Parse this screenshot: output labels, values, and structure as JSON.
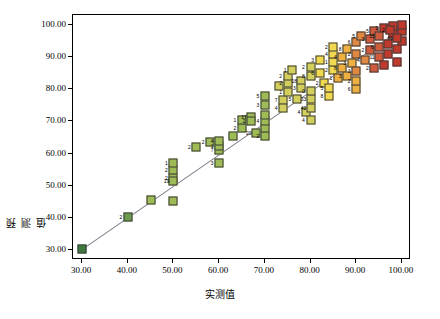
{
  "chart_data": {
    "type": "scatter",
    "title": "",
    "xlabel": "实测值",
    "ylabel": "预测值",
    "xlim": [
      28.0,
      102.0
    ],
    "ylim": [
      27.0,
      103.0
    ],
    "xticks": [
      "30.00",
      "40.00",
      "50.00",
      "60.00",
      "70.00",
      "80.00",
      "90.00",
      "100.00"
    ],
    "xtick_values": [
      30,
      40,
      50,
      60,
      70,
      80,
      90,
      100
    ],
    "yticks": [
      "30.00",
      "40.00",
      "50.00",
      "60.00",
      "70.00",
      "80.00",
      "90.00",
      "100.00"
    ],
    "ytick_values": [
      30,
      40,
      50,
      60,
      70,
      80,
      90,
      100
    ],
    "grid": false,
    "legend": null,
    "colormap": [
      "#3e7a3e",
      "#6f9b4e",
      "#9fbb55",
      "#d2cf5c",
      "#f0d84f",
      "#efb042",
      "#e08742",
      "#cf5b3c",
      "#c0392b"
    ],
    "marker": "square",
    "fit_line": {
      "from": [
        30,
        30.5
      ],
      "to": [
        100,
        99.0
      ]
    },
    "points": [
      {
        "x": 30.0,
        "y": 30.5,
        "c": 0,
        "label": ""
      },
      {
        "x": 40.0,
        "y": 40.4,
        "c": 1,
        "label": "2"
      },
      {
        "x": 45.0,
        "y": 45.5,
        "c": 2,
        "label": ""
      },
      {
        "x": 50.0,
        "y": 45.2,
        "c": 2,
        "label": ""
      },
      {
        "x": 50.0,
        "y": 52.5,
        "c": 2,
        "label": "2"
      },
      {
        "x": 50.0,
        "y": 55.0,
        "c": 2,
        "label": "2"
      },
      {
        "x": 50.0,
        "y": 57.0,
        "c": 2,
        "label": "1"
      },
      {
        "x": 50.0,
        "y": 51.5,
        "c": 2,
        "label": "19"
      },
      {
        "x": 55.0,
        "y": 62.0,
        "c": 2,
        "label": "2"
      },
      {
        "x": 58.0,
        "y": 63.5,
        "c": 2,
        "label": "2"
      },
      {
        "x": 60.0,
        "y": 57.0,
        "c": 2,
        "label": "3"
      },
      {
        "x": 60.0,
        "y": 61.0,
        "c": 2,
        "label": "7"
      },
      {
        "x": 60.0,
        "y": 62.5,
        "c": 2,
        "label": "1"
      },
      {
        "x": 60.0,
        "y": 64.0,
        "c": 2,
        "label": "4"
      },
      {
        "x": 63.0,
        "y": 65.5,
        "c": 2,
        "label": ""
      },
      {
        "x": 65.0,
        "y": 68.0,
        "c": 2,
        "label": "2"
      },
      {
        "x": 65.0,
        "y": 70.5,
        "c": 2,
        "label": "1"
      },
      {
        "x": 67.0,
        "y": 71.5,
        "c": 2,
        "label": "17"
      },
      {
        "x": 67.0,
        "y": 70.0,
        "c": 2,
        "label": "2"
      },
      {
        "x": 68.0,
        "y": 66.5,
        "c": 2,
        "label": "20"
      },
      {
        "x": 70.0,
        "y": 65.5,
        "c": 2,
        "label": "2"
      },
      {
        "x": 70.0,
        "y": 68.0,
        "c": 2,
        "label": ""
      },
      {
        "x": 70.0,
        "y": 70.0,
        "c": 2,
        "label": "4"
      },
      {
        "x": 70.0,
        "y": 72.0,
        "c": 2,
        "label": ""
      },
      {
        "x": 70.0,
        "y": 75.0,
        "c": 2,
        "label": "3"
      },
      {
        "x": 70.0,
        "y": 78.0,
        "c": 2,
        "label": "5"
      },
      {
        "x": 73.0,
        "y": 81.0,
        "c": 3,
        "label": ""
      },
      {
        "x": 74.0,
        "y": 76.5,
        "c": 3,
        "label": "7"
      },
      {
        "x": 74.0,
        "y": 74.0,
        "c": 3,
        "label": "4"
      },
      {
        "x": 75.0,
        "y": 79.0,
        "c": 3,
        "label": "1"
      },
      {
        "x": 75.0,
        "y": 82.0,
        "c": 3,
        "label": "2"
      },
      {
        "x": 75.0,
        "y": 84.0,
        "c": 3,
        "label": "2"
      },
      {
        "x": 76.0,
        "y": 86.0,
        "c": 3,
        "label": "1"
      },
      {
        "x": 77.0,
        "y": 77.0,
        "c": 3,
        "label": "5"
      },
      {
        "x": 78.0,
        "y": 82.5,
        "c": 3,
        "label": "18"
      },
      {
        "x": 78.0,
        "y": 80.5,
        "c": 3,
        "label": "3"
      },
      {
        "x": 79.0,
        "y": 73.0,
        "c": 3,
        "label": "4"
      },
      {
        "x": 80.0,
        "y": 70.5,
        "c": 3,
        "label": "4"
      },
      {
        "x": 80.0,
        "y": 74.0,
        "c": 3,
        "label": "42"
      },
      {
        "x": 80.0,
        "y": 77.0,
        "c": 3,
        "label": "33"
      },
      {
        "x": 80.0,
        "y": 79.5,
        "c": 3,
        "label": "0"
      },
      {
        "x": 80.0,
        "y": 84.0,
        "c": 3,
        "label": "8"
      },
      {
        "x": 80.0,
        "y": 87.0,
        "c": 3,
        "label": "2"
      },
      {
        "x": 82.0,
        "y": 89.0,
        "c": 4,
        "label": "3"
      },
      {
        "x": 82.0,
        "y": 85.0,
        "c": 4,
        "label": "6"
      },
      {
        "x": 83.0,
        "y": 82.0,
        "c": 4,
        "label": "2"
      },
      {
        "x": 84.0,
        "y": 78.0,
        "c": 4,
        "label": "8"
      },
      {
        "x": 84.0,
        "y": 80.5,
        "c": 4,
        "label": "5"
      },
      {
        "x": 85.0,
        "y": 86.0,
        "c": 4,
        "label": "2"
      },
      {
        "x": 85.0,
        "y": 88.5,
        "c": 4,
        "label": "1"
      },
      {
        "x": 85.0,
        "y": 91.0,
        "c": 4,
        "label": "4"
      },
      {
        "x": 85.0,
        "y": 93.0,
        "c": 4,
        "label": "2"
      },
      {
        "x": 86.0,
        "y": 83.5,
        "c": 5,
        "label": "1"
      },
      {
        "x": 87.0,
        "y": 86.5,
        "c": 5,
        "label": "8"
      },
      {
        "x": 87.0,
        "y": 90.0,
        "c": 5,
        "label": "4"
      },
      {
        "x": 88.0,
        "y": 92.5,
        "c": 5,
        "label": "8"
      },
      {
        "x": 88.0,
        "y": 84.0,
        "c": 5,
        "label": "3"
      },
      {
        "x": 89.0,
        "y": 88.0,
        "c": 5,
        "label": "3"
      },
      {
        "x": 90.0,
        "y": 80.0,
        "c": 5,
        "label": "6"
      },
      {
        "x": 90.0,
        "y": 82.5,
        "c": 5,
        "label": "2"
      },
      {
        "x": 90.0,
        "y": 85.5,
        "c": 6,
        "label": "3"
      },
      {
        "x": 90.0,
        "y": 91.0,
        "c": 6,
        "label": "2"
      },
      {
        "x": 90.0,
        "y": 94.5,
        "c": 6,
        "label": "6"
      },
      {
        "x": 91.0,
        "y": 96.5,
        "c": 6,
        "label": "5"
      },
      {
        "x": 92.0,
        "y": 89.0,
        "c": 6,
        "label": "4"
      },
      {
        "x": 93.0,
        "y": 92.0,
        "c": 7,
        "label": "2"
      },
      {
        "x": 93.0,
        "y": 95.5,
        "c": 7,
        "label": "3"
      },
      {
        "x": 94.0,
        "y": 98.0,
        "c": 7,
        "label": "5"
      },
      {
        "x": 94.0,
        "y": 86.5,
        "c": 7,
        "label": "2"
      },
      {
        "x": 95.0,
        "y": 90.0,
        "c": 7,
        "label": "11"
      },
      {
        "x": 95.0,
        "y": 93.0,
        "c": 7,
        "label": "6"
      },
      {
        "x": 95.0,
        "y": 96.5,
        "c": 7,
        "label": "15"
      },
      {
        "x": 96.0,
        "y": 99.0,
        "c": 8,
        "label": "1"
      },
      {
        "x": 96.0,
        "y": 87.5,
        "c": 8,
        "label": ""
      },
      {
        "x": 97.0,
        "y": 91.0,
        "c": 8,
        "label": ""
      },
      {
        "x": 97.0,
        "y": 94.0,
        "c": 8,
        "label": ""
      },
      {
        "x": 98.0,
        "y": 97.0,
        "c": 8,
        "label": ""
      },
      {
        "x": 98.0,
        "y": 99.5,
        "c": 8,
        "label": ""
      },
      {
        "x": 99.0,
        "y": 88.5,
        "c": 8,
        "label": ""
      },
      {
        "x": 99.0,
        "y": 92.5,
        "c": 8,
        "label": ""
      },
      {
        "x": 100.0,
        "y": 95.0,
        "c": 8,
        "label": ""
      },
      {
        "x": 100.0,
        "y": 98.0,
        "c": 8,
        "label": ""
      },
      {
        "x": 100.0,
        "y": 100.0,
        "c": 8,
        "label": ""
      },
      {
        "x": 99.0,
        "y": 96.0,
        "c": 8,
        "label": "61"
      },
      {
        "x": 97.5,
        "y": 98.5,
        "c": 8,
        "label": "2"
      }
    ]
  }
}
